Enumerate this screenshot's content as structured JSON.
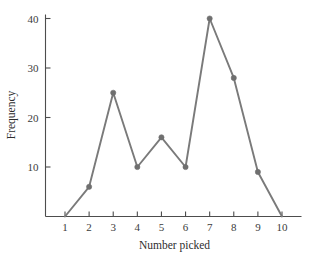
{
  "chart_data": {
    "type": "line",
    "title": "",
    "subtitle": "",
    "xlabel": "Number picked",
    "ylabel": "Frequency",
    "x": [
      1,
      2,
      3,
      4,
      5,
      6,
      7,
      8,
      9,
      10
    ],
    "values": [
      0,
      6,
      25,
      10,
      16,
      10,
      40,
      28,
      9,
      0
    ],
    "series": [
      {
        "name": "Frequency",
        "values": [
          0,
          6,
          25,
          10,
          16,
          10,
          40,
          28,
          9,
          0
        ]
      }
    ],
    "xlim": [
      1,
      10
    ],
    "ylim": [
      0,
      40
    ],
    "xticks": [
      "1",
      "2",
      "3",
      "4",
      "5",
      "6",
      "7",
      "8",
      "9",
      "10"
    ],
    "yticks": [
      "10",
      "20",
      "30",
      "40"
    ],
    "ytick_values": [
      10,
      20,
      30,
      40
    ],
    "grid": false,
    "legend": false,
    "legend_position": "none",
    "markers": "circle",
    "line_color": "#7a7a7a",
    "marker_color": "#6f6f6f",
    "axis_color": "#4d4d4d",
    "background_color": "#ffffff"
  },
  "axes": {
    "y_axis_label": "Frequency",
    "x_axis_label": "Number picked"
  }
}
